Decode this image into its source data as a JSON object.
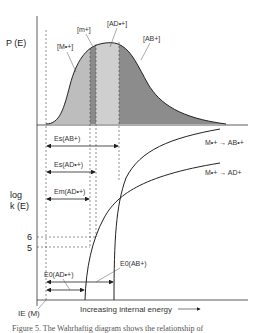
{
  "diagram": {
    "top_panel": {
      "y_axis_label": "P (E)",
      "regions": [
        {
          "label": "[M•+]",
          "color": "#bdbdbd"
        },
        {
          "label": "[m+]",
          "color": "#8a8a8a"
        },
        {
          "label": "[AD•+]",
          "color": "#cfcfcf"
        },
        {
          "label": "[AB+]",
          "color": "#8c8c8c"
        }
      ]
    },
    "bottom_panel": {
      "y_axis_label_line1": "log",
      "y_axis_label_line2": "k (E)",
      "ticks": [
        "6",
        "5"
      ],
      "energy_arrows": [
        {
          "label": "Es(AB+)"
        },
        {
          "label": "Es(AD•+)"
        },
        {
          "label": "Em(AD•+)"
        }
      ],
      "curves": [
        {
          "label": "M•+ → AB•+"
        },
        {
          "label": "M•+ → AD+"
        }
      ],
      "e0_labels": [
        "E0(AD•+)",
        "E0(AB+)"
      ],
      "ie_label": "IE (M)",
      "x_axis_label": "Increasing internal energy"
    },
    "caption": "Figure 5. The Wahrhaftig diagram shows the relationship of"
  }
}
